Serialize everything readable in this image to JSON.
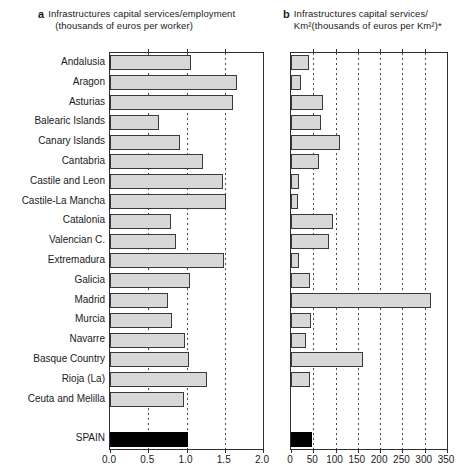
{
  "figure_type": "two-panel horizontal bar chart",
  "panels": [
    {
      "marker": "a",
      "title_line1": "Infrastructures capital services/employment",
      "title_line2": "(thousands of euros per worker)",
      "xmax": 2.0,
      "tick_values": [
        0,
        0.5,
        1.0,
        1.5,
        2.0
      ],
      "tick_labels": [
        "0.0",
        "0.5",
        "1.0",
        "1.5",
        "2.0"
      ],
      "gridline_values": [
        0.5,
        1.0,
        1.5
      ]
    },
    {
      "marker": "b",
      "title_line1": "Infrastructures capital services/",
      "title_line2": "Km²(thousands of euros per Km²)*",
      "xmax": 350,
      "tick_values": [
        0,
        50,
        100,
        150,
        200,
        250,
        300,
        350
      ],
      "tick_labels": [
        "0",
        "50",
        "100",
        "150",
        "200",
        "250",
        "300",
        "350"
      ],
      "gridline_values": [
        50,
        100,
        150,
        200,
        250,
        300
      ]
    }
  ],
  "chart_data": {
    "type": "bar",
    "orientation": "horizontal",
    "categories": [
      "Andalusia",
      "Aragon",
      "Asturias",
      "Balearic Islands",
      "Canary Islands",
      "Cantabria",
      "Castile and Leon",
      "Castile-La Mancha",
      "Catalonia",
      "Valencian C.",
      "Extremadura",
      "Galicia",
      "Madrid",
      "Murcia",
      "Navarre",
      "Basque Country",
      "Rioja (La)",
      "Ceuta and Melilla",
      "SPAIN"
    ],
    "total_category": "SPAIN",
    "series": [
      {
        "name": "Infrastructures capital services/employment (thousands of euros per worker)",
        "xlim": [
          0,
          2.0
        ],
        "values": [
          1.05,
          1.65,
          1.6,
          0.63,
          0.9,
          1.2,
          1.47,
          1.5,
          0.79,
          0.85,
          1.48,
          1.03,
          0.75,
          0.8,
          0.97,
          1.02,
          1.26,
          0.95,
          1.0
        ]
      },
      {
        "name": "Infrastructures capital services/Km² (thousands of euros per Km²)*",
        "xlim": [
          0,
          350
        ],
        "values": [
          38,
          21,
          69,
          66,
          108,
          60,
          15,
          14,
          92,
          84,
          16,
          40,
          312,
          42,
          32,
          160,
          41,
          null,
          45
        ]
      }
    ],
    "legend": null,
    "grid": "vertical dotted"
  },
  "colors": {
    "bar_fill": "#d8d8d8",
    "bar_border": "#3a3a3a",
    "total_bar_fill": "#000000",
    "axis_border": "#2e2e2e",
    "background": "#ffffff"
  }
}
